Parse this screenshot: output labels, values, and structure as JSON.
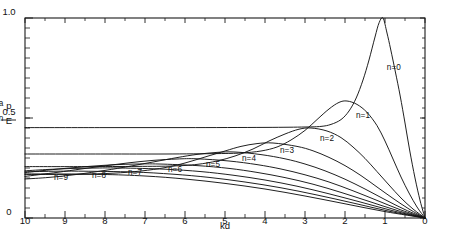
{
  "figure": {
    "orientation_deg": 180,
    "background": "#ffffff",
    "ink_color": "#141414"
  },
  "axes": {
    "x": {
      "title": "kd",
      "min": 0,
      "max": 10,
      "tick_labels": [
        "0",
        "1",
        "2",
        "3",
        "4",
        "5",
        "6",
        "7",
        "8",
        "9",
        "10"
      ],
      "tick_values": [
        0,
        1,
        2,
        3,
        4,
        5,
        6,
        7,
        8,
        9,
        10
      ],
      "minor_ticks_per_interval": 1,
      "position": "top-of-printed-image"
    },
    "y": {
      "title_numerator": "E",
      "title_numerator_sub": "n",
      "title_denominator": "p",
      "title_denominator_sub": "a",
      "title_plain": "En / pa",
      "min": 0,
      "max": 1.0,
      "tick_labels": [
        "0",
        "0.5",
        "1.0"
      ],
      "tick_values": [
        0,
        0.5,
        1.0
      ],
      "minor_tick_step": 0.05,
      "direction": "increases-downward-in-printed-image"
    }
  },
  "curve_labels": [
    {
      "text": "n=0",
      "x": 0.78,
      "y": 0.74
    },
    {
      "text": "n=1",
      "x": 1.55,
      "y": 0.5
    },
    {
      "text": "n=2",
      "x": 2.45,
      "y": 0.385
    },
    {
      "text": "n=3",
      "x": 3.45,
      "y": 0.325
    },
    {
      "text": "n=4",
      "x": 4.4,
      "y": 0.285
    },
    {
      "text": "n=5",
      "x": 5.3,
      "y": 0.255
    },
    {
      "text": "n=6",
      "x": 6.25,
      "y": 0.232
    },
    {
      "text": "n=7",
      "x": 7.25,
      "y": 0.214
    },
    {
      "text": "n=8",
      "x": 8.15,
      "y": 0.2
    },
    {
      "text": "n=9",
      "x": 9.1,
      "y": 0.188
    }
  ],
  "chart_data": {
    "type": "line",
    "title": "",
    "xlabel": "kd",
    "ylabel": "En / pa",
    "xlim": [
      0,
      10
    ],
    "ylim": [
      0,
      1.0
    ],
    "grid": false,
    "legend": "inline-curve-labels",
    "note": "Family of damped oscillatory response curves, one per mode index n. Each curve starts at (0,0), dips to a minimum (maximum magnitude) near kd ~ n+0.8, then relaxes toward a constant plateau as kd increases.",
    "series": [
      {
        "name": "n=0",
        "peak_x": 1.05,
        "peak_y": 1.0,
        "plateau_y": 0.455,
        "points": [
          [
            0,
            0
          ],
          [
            0.12,
            0.085
          ],
          [
            0.25,
            0.2
          ],
          [
            0.38,
            0.335
          ],
          [
            0.5,
            0.475
          ],
          [
            0.62,
            0.61
          ],
          [
            0.74,
            0.73
          ],
          [
            0.86,
            0.845
          ],
          [
            0.95,
            0.925
          ],
          [
            1.05,
            1.0
          ],
          [
            1.15,
            0.975
          ],
          [
            1.25,
            0.905
          ],
          [
            1.4,
            0.79
          ],
          [
            1.55,
            0.69
          ],
          [
            1.72,
            0.6
          ],
          [
            1.9,
            0.535
          ],
          [
            2.1,
            0.492
          ],
          [
            2.35,
            0.468
          ],
          [
            2.6,
            0.458
          ],
          [
            3.0,
            0.455
          ],
          [
            4.0,
            0.453
          ],
          [
            6.0,
            0.452
          ],
          [
            8.0,
            0.452
          ],
          [
            10.0,
            0.452
          ]
        ]
      },
      {
        "name": "n=1",
        "peak_x": 1.95,
        "peak_y": 0.585,
        "plateau_y": 0.322,
        "points": [
          [
            0,
            0
          ],
          [
            0.2,
            0.055
          ],
          [
            0.4,
            0.125
          ],
          [
            0.6,
            0.205
          ],
          [
            0.8,
            0.295
          ],
          [
            1.0,
            0.385
          ],
          [
            1.2,
            0.462
          ],
          [
            1.45,
            0.528
          ],
          [
            1.7,
            0.568
          ],
          [
            1.95,
            0.585
          ],
          [
            2.15,
            0.578
          ],
          [
            2.4,
            0.545
          ],
          [
            2.7,
            0.492
          ],
          [
            3.0,
            0.438
          ],
          [
            3.35,
            0.39
          ],
          [
            3.7,
            0.355
          ],
          [
            4.1,
            0.335
          ],
          [
            4.6,
            0.325
          ],
          [
            5.2,
            0.322
          ],
          [
            6.5,
            0.32
          ],
          [
            8.0,
            0.32
          ],
          [
            10.0,
            0.32
          ]
        ]
      },
      {
        "name": "n=2",
        "peak_x": 2.85,
        "peak_y": 0.45,
        "plateau_y": 0.258,
        "points": [
          [
            0,
            0
          ],
          [
            0.3,
            0.045
          ],
          [
            0.6,
            0.1
          ],
          [
            0.9,
            0.165
          ],
          [
            1.2,
            0.232
          ],
          [
            1.5,
            0.298
          ],
          [
            1.8,
            0.355
          ],
          [
            2.1,
            0.402
          ],
          [
            2.45,
            0.435
          ],
          [
            2.85,
            0.45
          ],
          [
            3.15,
            0.444
          ],
          [
            3.5,
            0.42
          ],
          [
            3.9,
            0.385
          ],
          [
            4.3,
            0.345
          ],
          [
            4.75,
            0.31
          ],
          [
            5.2,
            0.285
          ],
          [
            5.7,
            0.268
          ],
          [
            6.3,
            0.26
          ],
          [
            7.2,
            0.258
          ],
          [
            8.5,
            0.257
          ],
          [
            10.0,
            0.257
          ]
        ]
      },
      {
        "name": "n=3",
        "peak_x": 3.8,
        "peak_y": 0.375,
        "plateau_y": 0.218,
        "points": [
          [
            0,
            0
          ],
          [
            0.4,
            0.045
          ],
          [
            0.8,
            0.098
          ],
          [
            1.2,
            0.155
          ],
          [
            1.6,
            0.212
          ],
          [
            2.0,
            0.262
          ],
          [
            2.4,
            0.303
          ],
          [
            2.8,
            0.336
          ],
          [
            3.2,
            0.358
          ],
          [
            3.8,
            0.375
          ],
          [
            4.2,
            0.372
          ],
          [
            4.6,
            0.358
          ],
          [
            5.0,
            0.335
          ],
          [
            5.5,
            0.305
          ],
          [
            6.0,
            0.275
          ],
          [
            6.5,
            0.252
          ],
          [
            7.1,
            0.235
          ],
          [
            7.8,
            0.224
          ],
          [
            8.6,
            0.219
          ],
          [
            9.4,
            0.218
          ],
          [
            10.0,
            0.218
          ]
        ]
      },
      {
        "name": "n=4",
        "peak_x": 4.75,
        "peak_y": 0.33,
        "plateau_y": 0.192,
        "points": [
          [
            0,
            0
          ],
          [
            0.5,
            0.042
          ],
          [
            1.0,
            0.092
          ],
          [
            1.5,
            0.145
          ],
          [
            2.0,
            0.194
          ],
          [
            2.5,
            0.236
          ],
          [
            3.0,
            0.27
          ],
          [
            3.5,
            0.296
          ],
          [
            4.1,
            0.317
          ],
          [
            4.75,
            0.33
          ],
          [
            5.2,
            0.328
          ],
          [
            5.7,
            0.318
          ],
          [
            6.2,
            0.302
          ],
          [
            6.8,
            0.28
          ],
          [
            7.4,
            0.258
          ],
          [
            8.0,
            0.238
          ],
          [
            8.7,
            0.218
          ],
          [
            9.4,
            0.203
          ],
          [
            10.0,
            0.195
          ]
        ]
      },
      {
        "name": "n=5",
        "peak_x": 5.7,
        "peak_y": 0.296,
        "plateau_y": 0.172,
        "points": [
          [
            0,
            0
          ],
          [
            0.6,
            0.04
          ],
          [
            1.2,
            0.088
          ],
          [
            1.8,
            0.136
          ],
          [
            2.4,
            0.18
          ],
          [
            3.0,
            0.216
          ],
          [
            3.6,
            0.245
          ],
          [
            4.2,
            0.267
          ],
          [
            4.9,
            0.285
          ],
          [
            5.7,
            0.296
          ],
          [
            6.2,
            0.295
          ],
          [
            6.8,
            0.288
          ],
          [
            7.4,
            0.276
          ],
          [
            8.0,
            0.261
          ],
          [
            8.6,
            0.245
          ],
          [
            9.2,
            0.228
          ],
          [
            10.0,
            0.208
          ]
        ]
      },
      {
        "name": "n=6",
        "peak_x": 6.65,
        "peak_y": 0.27,
        "plateau_y": 0.158,
        "points": [
          [
            0,
            0
          ],
          [
            0.7,
            0.038
          ],
          [
            1.4,
            0.083
          ],
          [
            2.1,
            0.128
          ],
          [
            2.8,
            0.169
          ],
          [
            3.5,
            0.202
          ],
          [
            4.2,
            0.228
          ],
          [
            4.9,
            0.248
          ],
          [
            5.7,
            0.262
          ],
          [
            6.65,
            0.27
          ],
          [
            7.2,
            0.27
          ],
          [
            7.8,
            0.266
          ],
          [
            8.4,
            0.258
          ],
          [
            9.0,
            0.248
          ],
          [
            9.6,
            0.236
          ],
          [
            10.0,
            0.227
          ]
        ]
      },
      {
        "name": "n=7",
        "peak_x": 7.6,
        "peak_y": 0.25,
        "plateau_y": 0.146,
        "points": [
          [
            0,
            0
          ],
          [
            0.8,
            0.036
          ],
          [
            1.6,
            0.079
          ],
          [
            2.4,
            0.121
          ],
          [
            3.2,
            0.159
          ],
          [
            4.0,
            0.19
          ],
          [
            4.8,
            0.214
          ],
          [
            5.6,
            0.232
          ],
          [
            6.5,
            0.244
          ],
          [
            7.6,
            0.25
          ],
          [
            8.2,
            0.25
          ],
          [
            8.8,
            0.248
          ],
          [
            9.4,
            0.243
          ],
          [
            10.0,
            0.236
          ]
        ]
      },
      {
        "name": "n=8",
        "peak_x": 8.55,
        "peak_y": 0.234,
        "plateau_y": 0.137,
        "points": [
          [
            0,
            0
          ],
          [
            0.9,
            0.034
          ],
          [
            1.8,
            0.075
          ],
          [
            2.7,
            0.115
          ],
          [
            3.6,
            0.151
          ],
          [
            4.5,
            0.18
          ],
          [
            5.4,
            0.203
          ],
          [
            6.3,
            0.219
          ],
          [
            7.3,
            0.23
          ],
          [
            8.55,
            0.234
          ],
          [
            9.2,
            0.234
          ],
          [
            10.0,
            0.231
          ]
        ]
      },
      {
        "name": "n=9",
        "peak_x": 9.5,
        "peak_y": 0.22,
        "plateau_y": 0.129,
        "points": [
          [
            0,
            0
          ],
          [
            1.0,
            0.032
          ],
          [
            2.0,
            0.071
          ],
          [
            3.0,
            0.11
          ],
          [
            4.0,
            0.145
          ],
          [
            5.0,
            0.173
          ],
          [
            6.0,
            0.195
          ],
          [
            7.0,
            0.21
          ],
          [
            8.1,
            0.218
          ],
          [
            9.5,
            0.22
          ],
          [
            10.0,
            0.22
          ]
        ]
      }
    ]
  }
}
